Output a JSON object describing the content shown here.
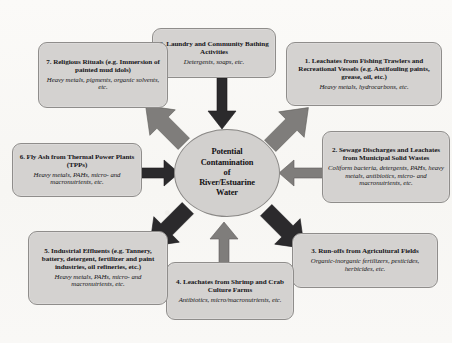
{
  "diagram": {
    "type": "radial-hub-and-spoke",
    "center": {
      "label": "Potential Contamination of River/Estuarine Water",
      "lines": [
        "Potential",
        "Contamination",
        "of",
        "River/Estuarine",
        "Water"
      ]
    },
    "colors": {
      "node_fill": "#d4d2d0",
      "node_border": "#8f8d8b",
      "center_fill": "#d2d0ce",
      "arrow_gray": "#7f7d7b",
      "arrow_dark": "#2b2a2c",
      "page_background": "#faf9f7",
      "text": "#17161a"
    },
    "nodes": [
      {
        "id": 1,
        "title": "1. Leachates from Fishing Trawlers and Recreational Vessels (e.g. Antifouling paints, grease, oil, etc.)",
        "sub": "Heavy metals, hydrocarbons, etc.",
        "arrow": {
          "direction": "down-left",
          "color": "gray"
        }
      },
      {
        "id": 2,
        "title": "2. Sewage Discharges and Leachates from Municipal Solid Wastes",
        "sub": "Coliform bacteria, detergents, PAHs, heavy metals, antibiotics, micro- and macronutrients, etc.",
        "arrow": {
          "direction": "left",
          "color": "gray"
        }
      },
      {
        "id": 3,
        "title": "3. Run-offs from Agricultural Fields",
        "sub": "Organic-inorganic fertilizers, pesticides, herbicides, etc.",
        "arrow": {
          "direction": "up-left",
          "color": "dark"
        }
      },
      {
        "id": 4,
        "title": "4. Leachates from Shrimp and Crab Culture Farms",
        "sub": "Antibiotics, micro/macronutrients, etc.",
        "arrow": {
          "direction": "up",
          "color": "gray"
        }
      },
      {
        "id": 5,
        "title": "5. Industrial Effluents (e.g. Tannery, battery, detergent, fertilizer and paint industries, oil refineries, etc.)",
        "sub": "Heavy metals, PAHs, micro- and macronutrients, etc.",
        "arrow": {
          "direction": "up-right",
          "color": "dark"
        }
      },
      {
        "id": 6,
        "title": "6. Fly Ash from Thermal Power Plants (TPPs)",
        "sub": "Heavy metals, PAHs, micro- and macronutrients, etc.",
        "arrow": {
          "direction": "right",
          "color": "dark"
        }
      },
      {
        "id": 7,
        "title": "7. Religious Rituals (e.g. Immersion of painted mud idols)",
        "sub": "Heavy metals, pigments, organic solvents, etc.",
        "arrow": {
          "direction": "down-right",
          "color": "gray"
        }
      },
      {
        "id": 8,
        "title": "8. Laundry and Community Bathing Activities",
        "sub": "Detergents, soaps, etc.",
        "arrow": {
          "direction": "down",
          "color": "dark"
        }
      }
    ]
  }
}
